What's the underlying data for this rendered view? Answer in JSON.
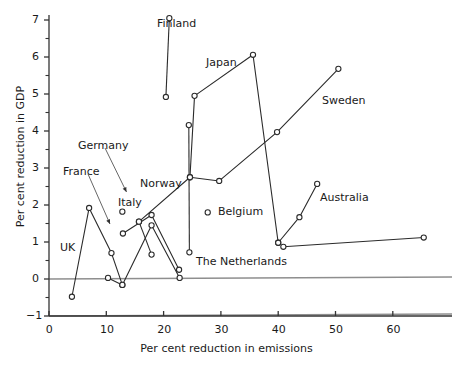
{
  "chart_data": {
    "type": "line",
    "title": "",
    "xlabel": "Per cent reduction in emissions",
    "ylabel": "Per cent reduction in GDP",
    "xlim": [
      0,
      66
    ],
    "ylim": [
      -1,
      7
    ],
    "xticks": [
      0,
      10,
      20,
      30,
      40,
      50,
      60
    ],
    "yticks": [
      -1,
      0,
      1,
      2,
      3,
      4,
      5,
      6,
      7
    ],
    "yminorticks": [
      -0.5,
      0.5,
      1.5,
      2.5,
      3.5,
      4.5,
      5.5,
      6.5
    ],
    "grid": false,
    "legend": "annotated-labels",
    "marker": "open-circle",
    "series": [
      {
        "name": "UK",
        "points": [
          [
            4.0,
            -0.48
          ],
          [
            7.0,
            1.92
          ],
          [
            10.9,
            0.7
          ],
          [
            12.8,
            -0.16
          ]
        ]
      },
      {
        "name": "Germany",
        "points": [
          [
            12.9,
            1.23
          ],
          [
            17.9,
            1.73
          ],
          [
            22.7,
            0.25
          ]
        ]
      },
      {
        "name": "France",
        "points": [
          [
            10.3,
            0.03
          ],
          [
            12.8,
            -0.16
          ],
          [
            17.9,
            1.45
          ],
          [
            22.8,
            0.03
          ]
        ]
      },
      {
        "name": "Italy",
        "points": [
          [
            12.8,
            1.82
          ]
        ]
      },
      {
        "name": "Norway",
        "points": [
          [
            15.7,
            1.55
          ],
          [
            17.9,
            0.66
          ]
        ]
      },
      {
        "name": "Norway-trend",
        "points": [
          [
            15.7,
            1.55
          ],
          [
            24.6,
            2.75
          ],
          [
            29.7,
            2.65
          ],
          [
            39.8,
            3.97
          ],
          [
            50.5,
            5.68
          ]
        ]
      },
      {
        "name": "Finland",
        "points": [
          [
            20.4,
            4.92
          ],
          [
            21.0,
            7.05
          ]
        ]
      },
      {
        "name": "The Netherlands",
        "points": [
          [
            24.5,
            0.72
          ],
          [
            24.4,
            4.16
          ]
        ]
      },
      {
        "name": "Japan",
        "points": [
          [
            24.6,
            2.75
          ],
          [
            25.4,
            4.95
          ],
          [
            35.6,
            6.06
          ],
          [
            40.0,
            0.98
          ]
        ]
      },
      {
        "name": "Belgium",
        "points": [
          [
            27.7,
            1.8
          ]
        ]
      },
      {
        "name": "Australia",
        "points": [
          [
            40.0,
            0.98
          ],
          [
            43.7,
            1.67
          ],
          [
            46.8,
            2.57
          ]
        ]
      },
      {
        "name": "Sweden-low",
        "points": [
          [
            40.9,
            0.87
          ],
          [
            65.4,
            1.12
          ]
        ]
      }
    ],
    "annotations": [
      {
        "text": "Finland",
        "x": 157,
        "y": 18
      },
      {
        "text": "Japan",
        "x": 206,
        "y": 57
      },
      {
        "text": "Sweden",
        "x": 322,
        "y": 95
      },
      {
        "text": "Germany",
        "x": 78,
        "y": 140
      },
      {
        "text": "France",
        "x": 63,
        "y": 166
      },
      {
        "text": "Norway",
        "x": 140,
        "y": 178
      },
      {
        "text": "Italy",
        "x": 118,
        "y": 197
      },
      {
        "text": "Belgium",
        "x": 218,
        "y": 206
      },
      {
        "text": "Australia",
        "x": 320,
        "y": 192
      },
      {
        "text": "UK",
        "x": 60,
        "y": 242
      },
      {
        "text": "The Netherlands",
        "x": 196,
        "y": 256
      }
    ]
  }
}
